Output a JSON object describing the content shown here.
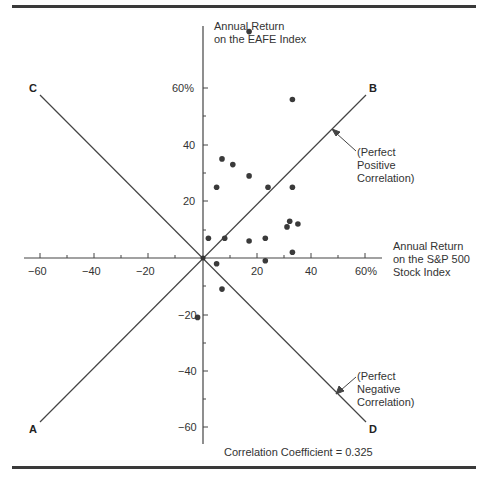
{
  "chart_data": {
    "type": "scatter",
    "title": "",
    "xlabel": "Annual Return on the S&P 500 Stock Index",
    "ylabel": "Annual Return on the EAFE Index",
    "xlabel_lines": [
      "Annual Return",
      "on the S&P 500",
      "Stock Index"
    ],
    "ylabel_lines": [
      "Annual Return",
      "on the EAFE Index"
    ],
    "xlim": [
      -65,
      65
    ],
    "ylim": [
      -65,
      80
    ],
    "x_ticks": [
      -60,
      -40,
      -20,
      20,
      40,
      60
    ],
    "x_tick_labels": [
      "−60",
      "−40",
      "−20",
      "20",
      "40",
      "60%"
    ],
    "y_ticks": [
      60,
      40,
      20,
      -20,
      -40,
      -60
    ],
    "y_tick_labels": [
      "60%",
      "40",
      "20",
      "−20",
      "−40",
      "−60"
    ],
    "grid": false,
    "points": [
      {
        "x": 17,
        "y": 80
      },
      {
        "x": 33,
        "y": 56
      },
      {
        "x": 7,
        "y": 35
      },
      {
        "x": 11,
        "y": 33
      },
      {
        "x": 17,
        "y": 29
      },
      {
        "x": 5,
        "y": 25
      },
      {
        "x": 24,
        "y": 25
      },
      {
        "x": 33,
        "y": 25
      },
      {
        "x": 32,
        "y": 13
      },
      {
        "x": 31,
        "y": 11
      },
      {
        "x": 35,
        "y": 12
      },
      {
        "x": 2,
        "y": 7
      },
      {
        "x": 8,
        "y": 7
      },
      {
        "x": 17,
        "y": 6
      },
      {
        "x": 23,
        "y": 7
      },
      {
        "x": 33,
        "y": 2
      },
      {
        "x": 5,
        "y": -2
      },
      {
        "x": 23,
        "y": -1
      },
      {
        "x": 7,
        "y": -11
      },
      {
        "x": -2,
        "y": -21
      }
    ],
    "reference_lines": [
      {
        "name": "Perfect Positive Correlation",
        "from": "A",
        "to": "B",
        "slope": 1
      },
      {
        "name": "Perfect Negative Correlation",
        "from": "C",
        "to": "D",
        "slope": -1
      }
    ],
    "corner_labels": [
      "A",
      "B",
      "C",
      "D"
    ],
    "annotations": [
      {
        "text": "(Perfect Positive Correlation)",
        "lines": [
          "(Perfect",
          "Positive",
          "Correlation)"
        ]
      },
      {
        "text": "(Perfect Negative Correlation)",
        "lines": [
          "(Perfect",
          "Negative",
          "Correlation)"
        ]
      },
      {
        "text": "Correlation Coefficient = 0.325"
      }
    ],
    "correlation_coefficient": 0.325
  },
  "labels": {
    "y_axis_line1": "Annual Return",
    "y_axis_line2": "on the EAFE Index",
    "x_axis_line1": "Annual Return",
    "x_axis_line2": "on the S&P 500",
    "x_axis_line3": "Stock Index",
    "pos_line1": "(Perfect",
    "pos_line2": "Positive",
    "pos_line3": "Correlation)",
    "neg_line1": "(Perfect",
    "neg_line2": "Negative",
    "neg_line3": "Correlation)",
    "corner_a": "A",
    "corner_b": "B",
    "corner_c": "C",
    "corner_d": "D",
    "footer": "Correlation Coefficient = 0.325",
    "xt0": "−60",
    "xt1": "−40",
    "xt2": "−20",
    "xt3": "20",
    "xt4": "40",
    "xt5": "60%",
    "yt0": "60%",
    "yt1": "40",
    "yt2": "20",
    "yt3": "−20",
    "yt4": "−40",
    "yt5": "−60"
  }
}
